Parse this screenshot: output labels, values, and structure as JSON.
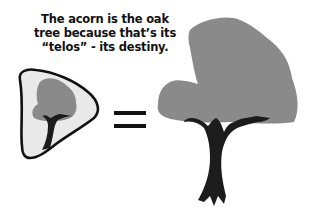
{
  "caption": {
    "lines": [
      "The acorn is the oak",
      "tree because that’s its",
      "“telos” - its destiny."
    ]
  },
  "diagram": {
    "left": "acorn-containing-small-oak-tree",
    "operator": "=",
    "right": "full-grown-oak-tree"
  },
  "colors": {
    "canopy": "#8a8a8a",
    "trunk": "#1c1c1c",
    "acorn_fill": "#e9e9e9",
    "acorn_outline": "#111111",
    "text": "#111111"
  }
}
